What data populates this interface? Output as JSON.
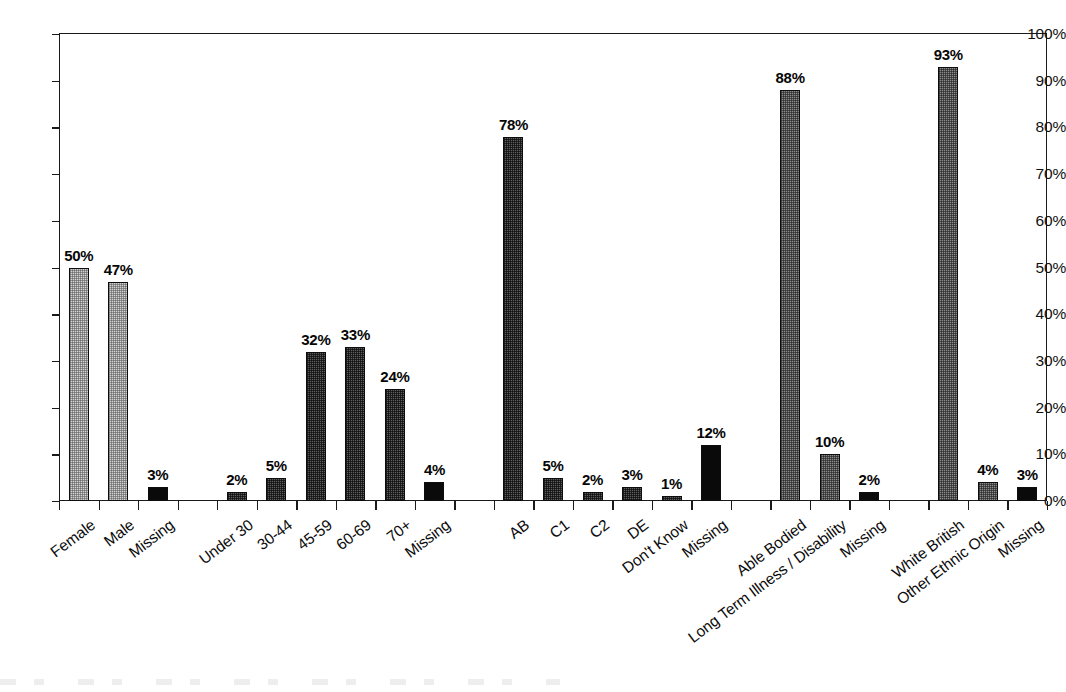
{
  "chart_data": {
    "type": "bar",
    "title": "",
    "subtitle": "",
    "xlabel": "",
    "ylabel": "",
    "ylim": [
      0,
      100
    ],
    "grid": false,
    "legend": "none",
    "value_suffix": "%",
    "y_ticks": [
      "0%",
      "10%",
      "20%",
      "30%",
      "40%",
      "50%",
      "60%",
      "70%",
      "80%",
      "90%",
      "100%"
    ],
    "y_tick_values": [
      0,
      10,
      20,
      30,
      40,
      50,
      60,
      70,
      80,
      90,
      100
    ],
    "categories": [
      "Female",
      "Male",
      "Missing",
      "Under 30",
      "30-44",
      "45-59",
      "60-69",
      "70+",
      "Missing",
      "AB",
      "C1",
      "C2",
      "DE",
      "Don't Know",
      "Missing",
      "Able Bodied",
      "Long Term Illness / Disability",
      "Missing",
      "White British",
      "Other Ethnic Origin",
      "Missing"
    ],
    "values": [
      50,
      47,
      3,
      2,
      5,
      32,
      33,
      24,
      4,
      78,
      5,
      2,
      3,
      1,
      12,
      88,
      10,
      2,
      93,
      4,
      3
    ],
    "value_labels": [
      "50%",
      "47%",
      "3%",
      "2%",
      "5%",
      "32%",
      "33%",
      "24%",
      "4%",
      "78%",
      "5%",
      "2%",
      "3%",
      "1%",
      "12%",
      "88%",
      "10%",
      "2%",
      "93%",
      "4%",
      "3%"
    ],
    "bar_styles": [
      "light",
      "light",
      "black",
      "dark",
      "dark",
      "dark",
      "dark",
      "dark",
      "black",
      "dark",
      "dark",
      "dark",
      "dark",
      "dark",
      "black",
      "mid",
      "mid",
      "black",
      "mid",
      "mid",
      "black"
    ],
    "groups": [
      {
        "name": "Gender",
        "start": 0,
        "count": 3
      },
      {
        "name": "Age",
        "start": 3,
        "count": 6
      },
      {
        "name": "Socio-economic Group",
        "start": 9,
        "count": 6
      },
      {
        "name": "Disability",
        "start": 15,
        "count": 3
      },
      {
        "name": "Ethnicity",
        "start": 18,
        "count": 3
      }
    ],
    "colors": {
      "light": "#d2d2d2",
      "mid": "#8d8d8d",
      "dark": "#5e5e5e",
      "black": "#0a0a0a",
      "axis": "#1a1a1a",
      "text": "#0b0b0b",
      "background": "#ffffff"
    }
  }
}
